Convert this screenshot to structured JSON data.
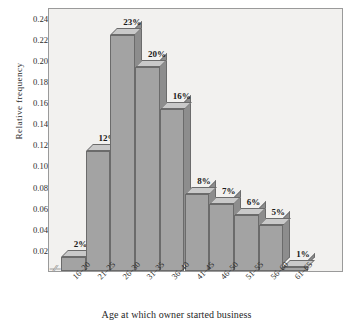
{
  "chart_data": {
    "type": "bar",
    "title": "",
    "subtitle": "",
    "xlabel": "Age at which owner started business",
    "ylabel": "Relative  frequency",
    "categories": [
      "16–20",
      "21–25",
      "26–30",
      "31–35",
      "36–40",
      "41–45",
      "46–50",
      "51–55",
      "56–60",
      "61–65"
    ],
    "values": [
      0.02,
      0.12,
      0.23,
      0.2,
      0.16,
      0.08,
      0.07,
      0.06,
      0.05,
      0.01
    ],
    "data_labels": [
      "2%",
      "12%",
      "23%",
      "20%",
      "16%",
      "8%",
      "7%",
      "6%",
      "5%",
      "1%"
    ],
    "ylim": [
      0,
      0.25
    ],
    "ytick_values": [
      0.02,
      0.04,
      0.06,
      0.08,
      0.1,
      0.12,
      0.14,
      0.16,
      0.18,
      0.2,
      0.22,
      0.24
    ],
    "ytick_labels": [
      "0.02",
      "0.04",
      "0.06",
      "0.08",
      "0.10",
      "0.12",
      "0.14",
      "0.16",
      "0.18",
      "0.20",
      "0.22",
      "0.24"
    ],
    "grid": false,
    "legend": null,
    "axis_break_symbol": "–//–",
    "style": "3d-histogram",
    "colors": {
      "bar_front": "#a3a3a3",
      "bar_top": "#c9c9c9",
      "bar_side": "#8d8d8d",
      "bar_edge": "#6b6b6b",
      "plot_background": "#f2f1ef",
      "page_background": "#ffffff",
      "text": "#1f1f1f",
      "axis": "#9a9a9a"
    }
  }
}
